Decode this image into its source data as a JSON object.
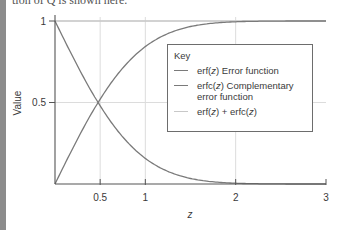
{
  "page": {
    "top_text": "tion of Q is shown here."
  },
  "chart_data": {
    "type": "line",
    "title": "",
    "xlabel": "z",
    "ylabel": "Value",
    "xlim": [
      0,
      3
    ],
    "ylim": [
      0,
      1
    ],
    "x_ticks": [
      0.5,
      1,
      2,
      3
    ],
    "x_tick_labels": [
      "0.5",
      "1",
      "2",
      "3"
    ],
    "y_ticks": [
      0.5,
      1
    ],
    "y_tick_labels": [
      "0.5",
      "1"
    ],
    "grid": {
      "vertical_at": [
        0.5,
        1,
        2
      ],
      "horizontal_at": [
        0.5,
        1
      ]
    },
    "legend": {
      "title": "Key",
      "position": "upper right",
      "entries": [
        {
          "label": "erf(z) Error function",
          "color": "#7a7a7a"
        },
        {
          "label": "erfc(z) Complementary\nerror function",
          "color": "#7a7a7a"
        },
        {
          "label": "erf(z) + erfc(z)",
          "color": "#c8c8c8"
        }
      ]
    },
    "x": [
      0,
      0.25,
      0.5,
      0.75,
      1,
      1.25,
      1.5,
      1.75,
      2,
      2.25,
      2.5,
      2.75,
      3
    ],
    "series": [
      {
        "name": "erf(z) Error function",
        "color": "#7a7a7a",
        "values": [
          0,
          0.276,
          0.52,
          0.711,
          0.843,
          0.923,
          0.966,
          0.987,
          0.995,
          0.9985,
          0.9996,
          0.9999,
          1.0
        ]
      },
      {
        "name": "erfc(z) Complementary error function",
        "color": "#7a7a7a",
        "values": [
          1,
          0.724,
          0.48,
          0.289,
          0.157,
          0.077,
          0.034,
          0.013,
          0.005,
          0.0015,
          0.0004,
          0.0001,
          0.0
        ]
      },
      {
        "name": "erf(z) + erfc(z)",
        "color": "#c8c8c8",
        "values": [
          1,
          1,
          1,
          1,
          1,
          1,
          1,
          1,
          1,
          1,
          1,
          1,
          1
        ]
      }
    ]
  }
}
